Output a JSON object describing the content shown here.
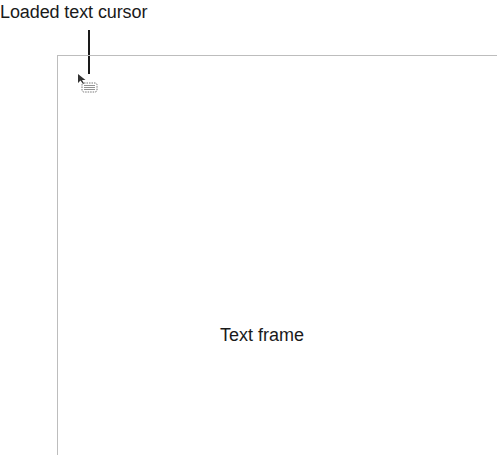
{
  "callouts": {
    "cursor_label": "Loaded text cursor",
    "frame_label": "Text frame"
  },
  "icons": {
    "cursor": "loaded-text-cursor-icon"
  },
  "colors": {
    "text": "#1a1a1a",
    "frame_border": "#bdbdbd",
    "cursor": "#555555"
  }
}
